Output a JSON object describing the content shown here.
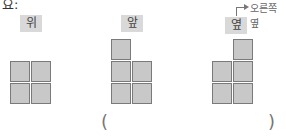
{
  "header": {
    "partial_text": "요:"
  },
  "views": [
    {
      "label": "위",
      "meaning": "top view"
    },
    {
      "label": "앞",
      "meaning": "front view"
    },
    {
      "label": "옆",
      "meaning": "side view"
    }
  ],
  "callout": {
    "text": "오른쪽 옆"
  },
  "answer": {
    "open_paren": "(",
    "close_paren": ")"
  },
  "colors": {
    "square_fill": "#c8c8c8",
    "square_border": "#7a7a7a",
    "label_bg": "#d9d9d9"
  }
}
